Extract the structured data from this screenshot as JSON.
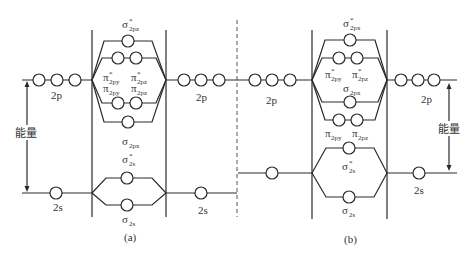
{
  "diagram": {
    "energy_label": "能量",
    "panels": [
      {
        "id": "a",
        "caption": "(a)",
        "ao_labels": {
          "p_left": "2p",
          "p_right": "2p",
          "s_left": "2s",
          "s_right": "2s"
        },
        "mo_labels": {
          "sigma_star_2p": {
            "base": "σ",
            "sup": "*",
            "sub": "2pz"
          },
          "pi_star_2py": {
            "base": "π",
            "sup": "*",
            "sub": "2py"
          },
          "pi_star_2pz": {
            "base": "π",
            "sup": "*",
            "sub": "2pz"
          },
          "pi_2py": {
            "base": "π",
            "sup": "",
            "sub": "2py"
          },
          "pi_2pz": {
            "base": "π",
            "sup": "",
            "sub": "2pz"
          },
          "sigma_2p": {
            "base": "σ",
            "sup": "",
            "sub": "2px"
          },
          "sigma_star_2s": {
            "base": "σ",
            "sup": "*",
            "sub": "2s"
          },
          "sigma_2s": {
            "base": "σ",
            "sup": "",
            "sub": "2s"
          }
        },
        "ordering": [
          "σ2s",
          "σ*2s",
          "σ2px",
          "π2py=π2pz",
          "π*2py=π*2pz",
          "σ*2px"
        ]
      },
      {
        "id": "b",
        "caption": "(b)",
        "ao_labels": {
          "p_left": "2p",
          "p_right": "2p",
          "s_right": "2s"
        },
        "mo_labels": {
          "sigma_star_2p": {
            "base": "σ",
            "sup": "*",
            "sub": "2px"
          },
          "pi_star_2py": {
            "base": "π",
            "sup": "*",
            "sub": "2py"
          },
          "pi_star_2pz": {
            "base": "π",
            "sup": "*",
            "sub": "2pz"
          },
          "sigma_2p": {
            "base": "σ",
            "sup": "",
            "sub": "2px"
          },
          "pi_2py": {
            "base": "π",
            "sup": "",
            "sub": "2py"
          },
          "pi_2pz": {
            "base": "π",
            "sup": "",
            "sub": "2pz"
          },
          "sigma_star_2s": {
            "base": "σ",
            "sup": "*",
            "sub": "2s"
          },
          "sigma_2s": {
            "base": "σ",
            "sup": "",
            "sub": "2s"
          }
        },
        "ordering": [
          "σ2s",
          "σ*2s",
          "π2py=π2pz",
          "σ2px",
          "π*2py=π*2pz",
          "σ*2px"
        ]
      }
    ]
  }
}
